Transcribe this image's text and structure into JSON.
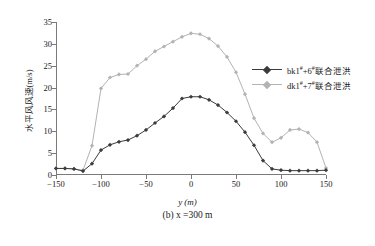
{
  "chart_data": {
    "type": "line",
    "title": "",
    "caption": "(b) x =300  m",
    "xlabel": "y (m)",
    "ylabel": "水平风风速(m/s)",
    "xlim": [
      -150,
      150
    ],
    "ylim": [
      0,
      35
    ],
    "xticks": [
      -150,
      -100,
      -50,
      0,
      50,
      100,
      150
    ],
    "yticks": [
      0,
      5,
      10,
      15,
      20,
      25,
      30,
      35
    ],
    "grid": false,
    "legend_position": "right",
    "series": [
      {
        "name": "bk1#+6#联合泄洪",
        "label_prefix": "bk1",
        "label_sup1": "#",
        "label_mid": "+6",
        "label_sup2": "#",
        "label_suffix": "联合泄洪",
        "color": "#3b3b3b",
        "marker": "diamond",
        "x": [
          -150,
          -140,
          -130,
          -120,
          -110,
          -100,
          -90,
          -80,
          -70,
          -60,
          -50,
          -40,
          -30,
          -20,
          -10,
          0,
          10,
          20,
          30,
          40,
          50,
          60,
          70,
          80,
          90,
          100,
          110,
          120,
          130,
          140,
          150
        ],
        "y": [
          1.5,
          1.5,
          1.4,
          0.9,
          2.6,
          5.7,
          6.9,
          7.6,
          8.0,
          9.0,
          10.3,
          11.9,
          13.4,
          15.3,
          17.5,
          17.9,
          17.9,
          17.2,
          16.0,
          14.3,
          12.3,
          9.8,
          6.8,
          3.3,
          1.4,
          1.1,
          1.0,
          1.0,
          1.0,
          1.0,
          1.1
        ]
      },
      {
        "name": "dk1#+7#联合泄洪",
        "label_prefix": "dk1",
        "label_sup1": "#",
        "label_mid": "+7",
        "label_sup2": "#",
        "label_suffix": "联合泄洪",
        "color": "#b3b3b3",
        "marker": "diamond",
        "x": [
          -150,
          -140,
          -130,
          -120,
          -110,
          -100,
          -90,
          -80,
          -70,
          -60,
          -50,
          -40,
          -30,
          -20,
          -10,
          0,
          10,
          20,
          30,
          40,
          50,
          60,
          70,
          80,
          90,
          100,
          110,
          120,
          130,
          140,
          150
        ],
        "y": [
          1.5,
          1.5,
          1.4,
          1.1,
          6.7,
          19.8,
          22.3,
          23.0,
          23.1,
          25.0,
          26.5,
          28.3,
          29.4,
          30.5,
          31.6,
          32.4,
          32.2,
          31.2,
          29.5,
          27.0,
          23.5,
          18.5,
          13.0,
          9.5,
          7.5,
          8.5,
          10.3,
          10.5,
          9.7,
          7.5,
          1.6
        ]
      }
    ]
  }
}
